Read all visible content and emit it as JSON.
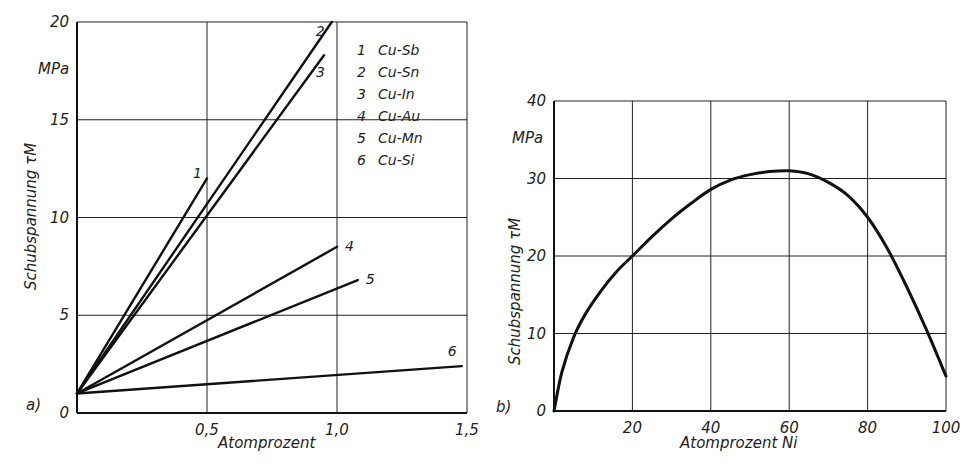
{
  "chart_data": [
    {
      "type": "line",
      "panel_label": "a)",
      "title": "",
      "xlabel": "Atomprozent",
      "ylabel": "Schubspannung τM",
      "yunit": "MPa",
      "xlim": [
        0,
        1.5
      ],
      "ylim": [
        0,
        20
      ],
      "x_ticks": [
        "0,5",
        "1,0",
        "1,5"
      ],
      "x_tick_values": [
        0.5,
        1.0,
        1.5
      ],
      "y_ticks": [
        "0",
        "5",
        "10",
        "15",
        "20"
      ],
      "y_tick_values": [
        0,
        5,
        10,
        15,
        20
      ],
      "grid": true,
      "legend_position": "upper right",
      "series": [
        {
          "id": "1",
          "name": "Cu-Sb",
          "x": [
            0,
            0.5
          ],
          "y": [
            1,
            12
          ]
        },
        {
          "id": "2",
          "name": "Cu-Sn",
          "x": [
            0,
            0.98
          ],
          "y": [
            1,
            20
          ]
        },
        {
          "id": "3",
          "name": "Cu-In",
          "x": [
            0,
            0.95
          ],
          "y": [
            1,
            18.3
          ]
        },
        {
          "id": "4",
          "name": "Cu-Au",
          "x": [
            0,
            1.0
          ],
          "y": [
            1,
            8.5
          ]
        },
        {
          "id": "5",
          "name": "Cu-Mn",
          "x": [
            0,
            1.08
          ],
          "y": [
            1,
            6.8
          ]
        },
        {
          "id": "6",
          "name": "Cu-Si",
          "x": [
            0,
            1.48
          ],
          "y": [
            1,
            2.4
          ]
        }
      ]
    },
    {
      "type": "line",
      "panel_label": "b)",
      "title": "",
      "xlabel": "Atomprozent Ni",
      "ylabel": "Schubspannung τM",
      "yunit": "MPa",
      "xlim": [
        0,
        100
      ],
      "ylim": [
        0,
        40
      ],
      "x_ticks": [
        "20",
        "40",
        "60",
        "80",
        "100"
      ],
      "x_tick_values": [
        20,
        40,
        60,
        80,
        100
      ],
      "y_ticks": [
        "0",
        "10",
        "20",
        "30",
        "40"
      ],
      "y_tick_values": [
        0,
        10,
        20,
        30,
        40
      ],
      "grid": true,
      "series": [
        {
          "name": "Cu-Ni",
          "x": [
            0,
            2,
            5,
            8,
            12,
            16,
            20,
            25,
            30,
            35,
            40,
            45,
            50,
            55,
            60,
            65,
            70,
            75,
            80,
            85,
            90,
            95,
            100
          ],
          "y": [
            0,
            5,
            9.5,
            12.5,
            15.5,
            18,
            20,
            22.5,
            24.8,
            26.8,
            28.6,
            29.8,
            30.5,
            30.9,
            31,
            30.6,
            29.5,
            27.8,
            25,
            21,
            16,
            10.5,
            4.5
          ]
        }
      ]
    }
  ],
  "figure": {
    "left_panel_label": "a)",
    "right_panel_label": "b)"
  }
}
